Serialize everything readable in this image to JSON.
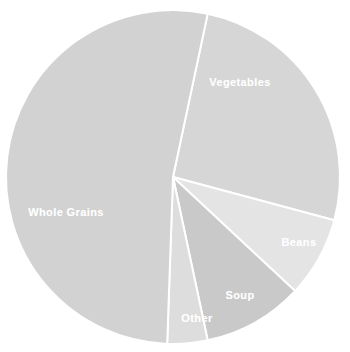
{
  "figure": {
    "clipped_title_fragment": "s",
    "background_color": "#ffffff"
  },
  "chart_data": {
    "type": "pie",
    "title": "",
    "subtitle": "",
    "xlabel": "",
    "ylabel": "",
    "legend_position": "none",
    "labels_inside_slices": true,
    "start_angle_deg_from_top": 12,
    "direction": "clockwise",
    "center": {
      "x": 173,
      "y": 177
    },
    "radius": 167,
    "categories": [
      "Vegetables",
      "Beans",
      "Soup",
      "Other",
      "Whole Grains"
    ],
    "values": [
      25.8,
      7.8,
      9.7,
      3.9,
      52.8
    ],
    "units": "percent",
    "slices": [
      {
        "label": "Vegetables",
        "value": 25.8,
        "color": "#d6d6d6",
        "start_angle": 12,
        "end_angle": 105,
        "label_x": 240,
        "label_y": 82
      },
      {
        "label": "Beans",
        "value": 7.8,
        "color": "#e4e4e4",
        "start_angle": 105,
        "end_angle": 133,
        "label_x": 299,
        "label_y": 242
      },
      {
        "label": "Soup",
        "value": 9.7,
        "color": "#c9c9c9",
        "start_angle": 133,
        "end_angle": 168,
        "label_x": 240,
        "label_y": 295
      },
      {
        "label": "Other",
        "value": 3.9,
        "color": "#dddddd",
        "start_angle": 168,
        "end_angle": 182,
        "label_x": 197,
        "label_y": 318
      },
      {
        "label": "Whole Grains",
        "value": 52.8,
        "color": "#d2d2d2",
        "start_angle": 182,
        "end_angle": 372,
        "label_x": 66,
        "label_y": 212
      }
    ],
    "slice_border_color": "#ffffff",
    "slice_border_width": 2
  }
}
